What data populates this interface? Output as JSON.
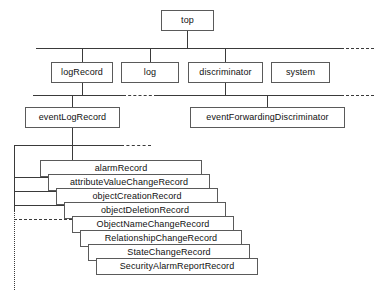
{
  "diagram": {
    "root": {
      "label": "top"
    },
    "level2": [
      {
        "label": "logRecord"
      },
      {
        "label": "log"
      },
      {
        "label": "discriminator"
      },
      {
        "label": "system"
      }
    ],
    "level3": [
      {
        "label": "eventLogRecord"
      },
      {
        "label": "eventForwardingDiscriminator"
      }
    ],
    "records": [
      {
        "label": "alarmRecord"
      },
      {
        "label": "attributeValueChangeRecord"
      },
      {
        "label": "objectCreationRecord"
      },
      {
        "label": "objectDeletionRecord"
      },
      {
        "label": "ObjectNameChangeRecord"
      },
      {
        "label": "RelationshipChangeRecord"
      },
      {
        "label": "StateChangeRecord"
      },
      {
        "label": "SecurityAlarmReportRecord"
      }
    ],
    "colors": {
      "box_border": "#5a5a5a",
      "connector": "#3a3a3a",
      "background": "#ffffff",
      "text": "#111111"
    }
  }
}
